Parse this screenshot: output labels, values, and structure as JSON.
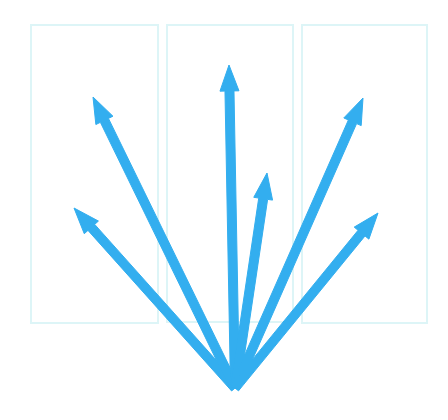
{
  "canvas": {
    "width": 448,
    "height": 420,
    "background_color": "#ffffff",
    "title": "Radial arrow burst over three panels"
  },
  "style": {
    "arrow_color": "#33aeef",
    "arrow_stroke_width": 9,
    "arrow_head_length": 26,
    "arrow_head_width": 19,
    "panel_border_color": "#ddf5f7",
    "panel_fill_color": "#ffffff",
    "panel_border_width": 2
  },
  "panels": [
    {
      "name": "panel-left",
      "label": "Left panel",
      "x": 31,
      "y": 25,
      "width": 127,
      "height": 298
    },
    {
      "name": "panel-center",
      "label": "Center panel",
      "x": 167,
      "y": 25,
      "width": 126,
      "height": 297
    },
    {
      "name": "panel-right",
      "label": "Right panel",
      "x": 302,
      "y": 25,
      "width": 125,
      "height": 298
    }
  ],
  "origin": {
    "name": "arrow-origin",
    "label": "Common origin",
    "x": 235,
    "y": 388
  },
  "arrows": [
    {
      "name": "arrow-far-left",
      "label": "Far left arrow",
      "tip_x": 74,
      "tip_y": 208,
      "angle_deg": 133,
      "length": 241
    },
    {
      "name": "arrow-upper-left",
      "label": "Upper left arrow",
      "tip_x": 93,
      "tip_y": 97,
      "angle_deg": 117,
      "length": 321
    },
    {
      "name": "arrow-center",
      "label": "Center vertical arrow",
      "tip_x": 229,
      "tip_y": 65,
      "angle_deg": 91,
      "length": 323
    },
    {
      "name": "arrow-short-right",
      "label": "Short right arrow",
      "tip_x": 267,
      "tip_y": 173,
      "angle_deg": 82,
      "length": 217
    },
    {
      "name": "arrow-upper-right",
      "label": "Upper right arrow",
      "tip_x": 363,
      "tip_y": 98,
      "angle_deg": 66,
      "length": 318
    },
    {
      "name": "arrow-far-right",
      "label": "Far right arrow",
      "tip_x": 378,
      "tip_y": 213,
      "angle_deg": 50,
      "length": 228
    }
  ],
  "chart_data": {
    "type": "scatter",
    "xlabel": "",
    "ylabel": "",
    "xlim": [
      0,
      448
    ],
    "ylim": [
      0,
      420
    ],
    "grid": false,
    "legend": "none",
    "annotations": [
      "Six arrows radiate upward from a single origin point at (235, 388)",
      "Three faint pale-cyan rectangular panels sit behind the arrows"
    ],
    "series": [
      {
        "name": "arrow-vectors",
        "origin": [
          235,
          388
        ],
        "tips": [
          [
            74,
            208
          ],
          [
            93,
            97
          ],
          [
            229,
            65
          ],
          [
            267,
            173
          ],
          [
            363,
            98
          ],
          [
            378,
            213
          ]
        ],
        "angles_deg": [
          133,
          117,
          91,
          82,
          66,
          50
        ],
        "lengths": [
          241,
          321,
          323,
          217,
          318,
          228
        ]
      }
    ]
  }
}
